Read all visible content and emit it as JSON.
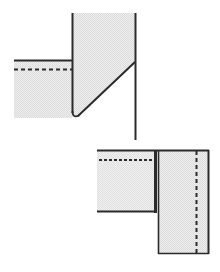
{
  "figure": {
    "canvas": {
      "width": 220,
      "height": 272
    },
    "colors": {
      "background": "#ffffff",
      "fabric_fill": "#e9e9e9",
      "fabric_fill_alt": "#ececec",
      "line": "#2b2b2b",
      "line_soft": "#4a4a4a",
      "hatch": "#cfcfcf"
    },
    "strokes": {
      "edge_width": 2.0,
      "thick_edge_width": 3.0,
      "thin_edge_width": 1.6,
      "stitch_width": 1.8,
      "stitch_dash": "4 3",
      "stitch_dash_fine": "3 2"
    },
    "upper_assembly": {
      "name": "upper-seam-assembly",
      "vertical_panel": {
        "name": "vertical-fabric-panel",
        "points": "72,13 135,13 135,62 75,118 72,118",
        "top_left_x": 72,
        "top_y": 13,
        "top_right_x": 135,
        "diagonal_start": [
          135,
          62
        ],
        "diagonal_end": [
          75,
          118
        ]
      },
      "horizontal_band": {
        "name": "horizontal-fabric-band",
        "points": "14,60 72,60 72,118 14,118",
        "left_x": 14,
        "right_x": 72,
        "top_y": 60,
        "bottom_y": 118
      },
      "band_top_edge": {
        "name": "band-top-edge-line",
        "x1": 14,
        "y1": 60,
        "x2": 72,
        "y2": 60
      },
      "band_stitch_line": {
        "name": "band-stitch-line",
        "x1": 14,
        "y1": 69,
        "x2": 72,
        "y2": 69
      },
      "panel_left_edge": {
        "name": "panel-left-edge-line",
        "x1": 72,
        "y1": 13,
        "x2": 72,
        "y2": 118
      },
      "panel_right_edge": {
        "name": "panel-right-edge-line",
        "x1": 135,
        "y1": 13,
        "x2": 135,
        "y2": 140
      },
      "diagonal_fold": {
        "name": "diagonal-fold-line",
        "x1": 135,
        "y1": 62,
        "x2": 76,
        "y2": 117
      },
      "corner_curve": {
        "name": "rounded-corner-path",
        "d": "M 72,112 Q 72,118 78,115"
      }
    },
    "lower_assembly": {
      "name": "lower-seam-assembly",
      "left_panel": {
        "name": "left-fabric-panel",
        "points": "97,150 155,150 155,212 97,212",
        "left_x": 97,
        "right_x": 155,
        "top_y": 150,
        "bottom_y": 212
      },
      "right_panel": {
        "name": "right-fabric-panel",
        "points": "158,150 208,150 208,254 158,254",
        "left_x": 158,
        "right_x": 208,
        "top_y": 150,
        "bottom_y": 254
      },
      "top_edge": {
        "name": "assembly-top-edge-line",
        "x1": 97,
        "y1": 150,
        "x2": 208,
        "y2": 150
      },
      "left_stitch_line": {
        "name": "left-panel-stitch-line",
        "x1": 99,
        "y1": 160,
        "x2": 155,
        "y2": 160
      },
      "center_seam_thick": {
        "name": "center-seam-line",
        "x1": 155,
        "y1": 150,
        "x2": 155,
        "y2": 213
      },
      "center_seam_thin": {
        "name": "center-seam-extension-line",
        "x1": 158,
        "y1": 150,
        "x2": 158,
        "y2": 254
      },
      "left_panel_bottom": {
        "name": "left-panel-bottom-edge",
        "x1": 97,
        "y1": 212,
        "x2": 157,
        "y2": 212
      },
      "right_stitch_line": {
        "name": "right-panel-stitch-line",
        "x1": 196,
        "y1": 151,
        "x2": 196,
        "y2": 253
      },
      "right_outer_edge": {
        "name": "right-panel-outer-edge",
        "x1": 208,
        "y1": 150,
        "x2": 208,
        "y2": 254
      },
      "bottom_edge": {
        "name": "assembly-bottom-edge-line",
        "x1": 158,
        "y1": 254,
        "x2": 208,
        "y2": 254
      }
    }
  }
}
